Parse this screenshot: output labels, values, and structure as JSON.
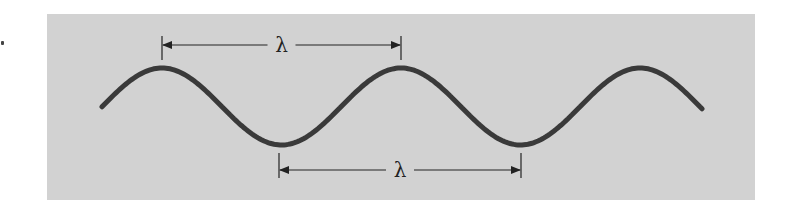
{
  "diagram": {
    "title": "",
    "panel": {
      "x": 47,
      "y": 14,
      "width": 708,
      "height": 186,
      "fill": "#d2d2d2"
    },
    "wave": {
      "color": "#3a3a3a",
      "stroke_width": 5,
      "start": {
        "x": 102,
        "y": 106
      },
      "end": {
        "x": 702,
        "y": 107
      },
      "crests": [
        {
          "x": 162,
          "y": 68
        },
        {
          "x": 401,
          "y": 68
        },
        {
          "x": 641,
          "y": 68
        }
      ],
      "troughs": [
        {
          "x": 279,
          "y": 145
        },
        {
          "x": 521,
          "y": 145
        }
      ]
    },
    "dimension_lines": [
      {
        "label": "λ",
        "from_x": 162,
        "to_x": 401,
        "y": 45,
        "tick_top": 36,
        "tick_bottom": 60,
        "description": "wavelength measured crest to crest"
      },
      {
        "label": "λ",
        "from_x": 279,
        "to_x": 521,
        "y": 170,
        "tick_top": 153,
        "tick_bottom": 178,
        "description": "wavelength measured trough to trough"
      }
    ]
  }
}
